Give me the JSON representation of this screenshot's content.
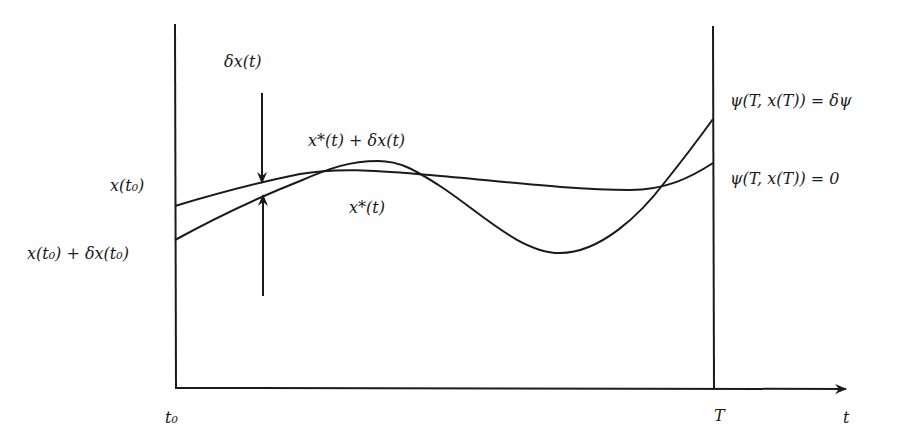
{
  "diagram": {
    "type": "variational-trajectory-figure",
    "colors": {
      "stroke": "#1a1a1a",
      "background": "#ffffff"
    },
    "axes": {
      "left_vertical_axis": {
        "x": 175,
        "y_top": 24,
        "y_bottom": 388
      },
      "right_vertical_line": {
        "x": 713,
        "y_top": 26,
        "y_bottom": 388
      },
      "time_axis": {
        "y": 388,
        "x_start": 175,
        "x_end": 848,
        "arrow": true
      }
    },
    "labels": {
      "delta_x_t": "δx(t)",
      "perturbed_curve": "x*(t) + δx(t)",
      "optimal_curve": "x*(t)",
      "x_t0": "x(t₀)",
      "x_t0_perturbed": "x(t₀) + δx(t₀)",
      "psi_delta": "ψ(T, x(T)) = δψ",
      "psi_zero": "ψ(T, x(T)) = 0",
      "t0": "t₀",
      "T": "T",
      "t": "t"
    },
    "curves": [
      {
        "name": "optimal-trajectory",
        "label": "x*(t)",
        "start": [
          175,
          206
        ],
        "end": [
          713,
          163
        ],
        "path": "M175,206 C215,194 255,183 300,174 C340,167 380,171 430,175 C500,181 570,190 630,190 C665,190 690,178 713,163"
      },
      {
        "name": "perturbed-trajectory",
        "label": "x*(t) + δx(t)",
        "start": [
          175,
          240
        ],
        "end": [
          713,
          119
        ],
        "path": "M175,240 C215,218 262,196 300,181 C330,168 350,161 378,161 C400,161 415,170 440,186 C480,212 520,253 560,253 C600,253 640,215 665,182 C685,157 700,137 713,119"
      }
    ],
    "variation_marker": {
      "x": 262,
      "upper_arrow": {
        "from_y": 93,
        "to_y": 185
      },
      "lower_arrow": {
        "from_y": 296,
        "to_y": 193
      }
    }
  }
}
